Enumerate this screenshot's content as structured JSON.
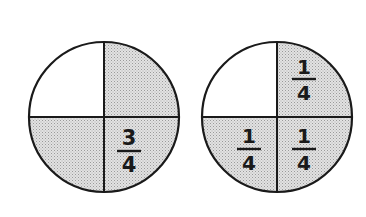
{
  "diagram": {
    "type": "fraction-circles",
    "colors": {
      "shade": "#cfcfcf",
      "line": "#1a1a1a",
      "background": "#ffffff"
    },
    "circles": [
      {
        "id": "left",
        "quarters_shaded": [
          "top-right",
          "bottom-left",
          "bottom-right"
        ],
        "label": {
          "numerator": "3",
          "denominator": "4",
          "quadrant": "bottom-right"
        }
      },
      {
        "id": "right",
        "quarters_shaded": [
          "top-right",
          "bottom-left",
          "bottom-right"
        ],
        "labels": [
          {
            "numerator": "1",
            "denominator": "4",
            "quadrant": "top-right"
          },
          {
            "numerator": "1",
            "denominator": "4",
            "quadrant": "bottom-left"
          },
          {
            "numerator": "1",
            "denominator": "4",
            "quadrant": "bottom-right"
          }
        ]
      }
    ]
  }
}
